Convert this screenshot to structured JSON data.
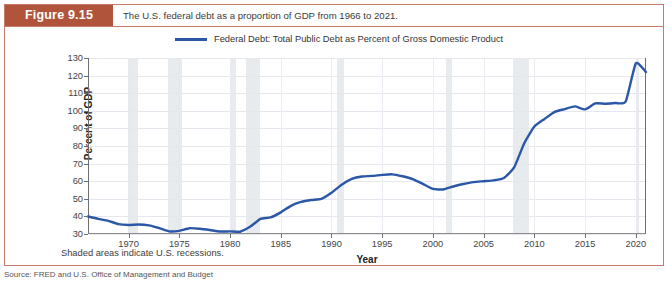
{
  "figure": {
    "badge": "Figure 9.15",
    "caption": "The U.S. federal debt as a proportion of GDP from 1966 to 2021.",
    "note": "Shaded areas indicate U.S. recessions.",
    "source": "Source: FRED and U.S. Office of Management and Budget",
    "accent_color": "#b0553c",
    "border_color": "#c9796a"
  },
  "chart_data": {
    "type": "line",
    "title": "",
    "xlabel": "Year",
    "ylabel": "Percent of GDP",
    "xlim": [
      1966,
      2021
    ],
    "ylim": [
      30,
      130
    ],
    "ytick_step": 10,
    "xtick_step": 5,
    "grid": true,
    "legend_position": "top",
    "line_color": "#2a57a6",
    "recession_color": "#e3e8ea",
    "yticks": [
      30,
      40,
      50,
      60,
      70,
      80,
      90,
      100,
      110,
      120,
      130
    ],
    "xticks": [
      1970,
      1975,
      1980,
      1985,
      1990,
      1995,
      2000,
      2005,
      2010,
      2015,
      2020
    ],
    "series": [
      {
        "name": "Federal Debt: Total Public Debt as Percent of Gross Domestic Product",
        "x": [
          1966,
          1967,
          1968,
          1969,
          1970,
          1971,
          1972,
          1973,
          1974,
          1975,
          1976,
          1977,
          1978,
          1979,
          1980,
          1981,
          1982,
          1983,
          1984,
          1985,
          1986,
          1987,
          1988,
          1989,
          1990,
          1991,
          1992,
          1993,
          1994,
          1995,
          1996,
          1997,
          1998,
          1999,
          2000,
          2001,
          2002,
          2003,
          2004,
          2005,
          2006,
          2007,
          2008,
          2009,
          2010,
          2011,
          2012,
          2013,
          2014,
          2015,
          2016,
          2017,
          2018,
          2019,
          2020,
          2021
        ],
        "values": [
          40.0,
          38.6,
          37.5,
          35.6,
          35.1,
          35.4,
          34.9,
          33.4,
          31.5,
          31.8,
          33.3,
          33.0,
          32.3,
          31.4,
          31.5,
          31.3,
          34.2,
          38.6,
          39.4,
          42.3,
          46.0,
          48.2,
          49.3,
          49.9,
          53.4,
          58.0,
          61.3,
          62.7,
          63.0,
          63.6,
          63.9,
          62.8,
          61.2,
          58.5,
          55.6,
          55.3,
          57.0,
          58.4,
          59.5,
          60.0,
          60.5,
          61.8,
          67.8,
          81.6,
          91.1,
          95.4,
          99.4,
          101.0,
          102.5,
          100.8,
          104.2,
          104.0,
          104.4,
          105.3,
          127.0,
          122.0
        ]
      }
    ],
    "recessions": [
      {
        "start": 1969.92,
        "end": 1970.92
      },
      {
        "start": 1973.92,
        "end": 1975.25
      },
      {
        "start": 1980.08,
        "end": 1980.58
      },
      {
        "start": 1981.58,
        "end": 1982.92
      },
      {
        "start": 1990.58,
        "end": 1991.25
      },
      {
        "start": 2001.25,
        "end": 2001.92
      },
      {
        "start": 2007.92,
        "end": 2009.5
      },
      {
        "start": 2020.08,
        "end": 2020.33
      }
    ]
  }
}
